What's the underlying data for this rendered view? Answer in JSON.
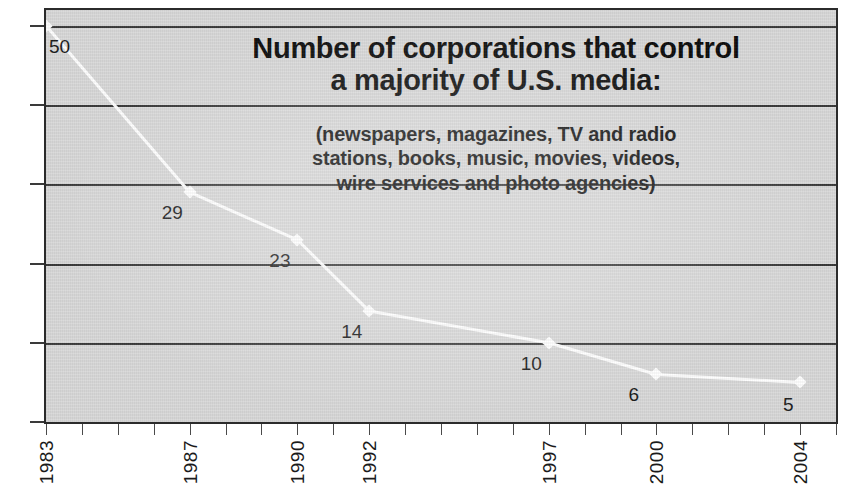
{
  "chart_data": {
    "type": "line",
    "title": "Number of corporations that control a majority of U.S. media:",
    "title_line1": "Number of corporations that control",
    "title_line2": "a majority of U.S. media:",
    "subtitle": "(newspapers, magazines, TV and radio stations, books, music, movies, videos, wire services and photo agencies)",
    "subtitle_line1": "(newspapers, magazines, TV and radio",
    "subtitle_line2": "stations, books, music, movies, videos,",
    "subtitle_line3": "wire services and photo agencies)",
    "xlabel": "",
    "ylabel": "",
    "x": [
      1983,
      1987,
      1990,
      1992,
      1997,
      2000,
      2004
    ],
    "categories": [
      "1983",
      "1987",
      "1990",
      "1992",
      "1997",
      "2000",
      "2004"
    ],
    "values": [
      50,
      29,
      23,
      14,
      10,
      6,
      5
    ],
    "point_labels": [
      "50",
      "29",
      "23",
      "14",
      "10",
      "6",
      "5"
    ],
    "ylim": [
      0,
      52
    ],
    "xlim": [
      1983,
      2005
    ],
    "yticks": [
      0,
      10,
      20,
      30,
      40,
      50
    ],
    "ytick_labels": [
      "0",
      "10",
      "20",
      "30",
      "40",
      "50"
    ],
    "grid": true,
    "grid_axis": "y",
    "legend": false,
    "line_color": "#ffffff",
    "marker": "diamond",
    "background_color": "#d9d9d9",
    "grid_color": "#3a3a3a",
    "text_color": "#1a1a1a"
  }
}
